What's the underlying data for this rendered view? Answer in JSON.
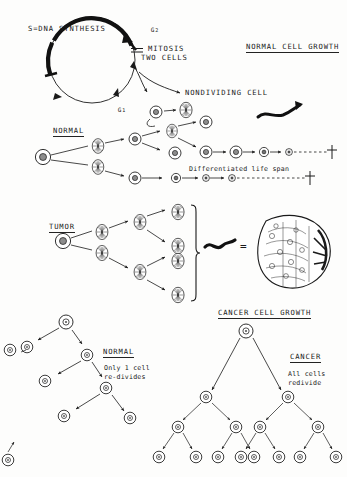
{
  "diagram": {
    "title_normal": "NORMAL CELL GROWTH",
    "title_cancer": "CANCER CELL GROWTH"
  },
  "cell_cycle": {
    "s_phase_label": "S=DNA SYNTHESIS",
    "g2_label": "G",
    "g2_sub": "2",
    "g1_label": "G",
    "g1_sub": "1",
    "mitosis_label": "MITOSIS",
    "two_cells_label": "TWO CELLS",
    "nondividing_label": "NONDIVIDING CELL"
  },
  "normal_lineage": {
    "heading": "NORMAL",
    "lifespan_label": "Differentiated life span"
  },
  "tumor_lineage": {
    "heading": "TUMOR",
    "equals": "="
  },
  "bottom_normal": {
    "heading": "NORMAL",
    "line1": "Only 1 cell",
    "line2": "re-divides"
  },
  "bottom_cancer": {
    "heading": "CANCER",
    "line1": "All cells",
    "line2": "redivide"
  },
  "colors": {
    "ink": "#1a1a1a",
    "nucleus_fill": "#8c8c8c",
    "paper": "#fdfdfc"
  }
}
